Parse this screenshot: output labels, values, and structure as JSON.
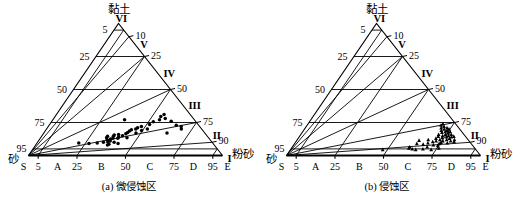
{
  "figure": {
    "type": "ternary-diagram-pair",
    "axis_labels": {
      "apex": "黏土",
      "left": "砂",
      "right": "粉砂"
    },
    "bottom_axis": {
      "letters": [
        "S",
        "A",
        "B",
        "C",
        "D",
        "E"
      ],
      "ticks": [
        "5",
        "25",
        "50",
        "75",
        "95"
      ]
    },
    "left_axis_ticks": [
      "5",
      "25",
      "50",
      "75",
      "95"
    ],
    "right_axis_ticks": [
      "90",
      "75",
      "50",
      "25",
      "10"
    ],
    "region_labels": [
      "VI",
      "V",
      "IV",
      "III",
      "II",
      "I"
    ]
  },
  "panels": [
    {
      "id": "a",
      "caption": "(a) 微侵蚀区",
      "marker": "circle",
      "chart_data": {
        "type": "scatter",
        "title": "(a) 微侵蚀区",
        "xlabel": "砂",
        "ylabel": "黏土",
        "x2label": "粉砂",
        "points": [
          [
            31.0,
            9.5
          ],
          [
            36.0,
            9.0
          ],
          [
            40.5,
            9.5
          ],
          [
            44.0,
            10.0
          ],
          [
            46.5,
            10.5
          ],
          [
            47.0,
            12.0
          ],
          [
            47.5,
            13.5
          ],
          [
            48.0,
            11.0
          ],
          [
            48.5,
            14.5
          ],
          [
            49.0,
            12.5
          ],
          [
            49.5,
            10.0
          ],
          [
            50.5,
            13.0
          ],
          [
            51.5,
            14.5
          ],
          [
            52.5,
            15.5
          ],
          [
            53.0,
            13.0
          ],
          [
            54.0,
            14.0
          ],
          [
            55.0,
            16.0
          ],
          [
            56.5,
            15.0
          ],
          [
            58.0,
            13.5
          ],
          [
            59.0,
            16.5
          ],
          [
            60.5,
            17.5
          ],
          [
            62.0,
            18.5
          ],
          [
            63.5,
            19.5
          ],
          [
            64.5,
            17.0
          ],
          [
            66.0,
            20.0
          ],
          [
            67.5,
            21.0
          ],
          [
            68.5,
            19.0
          ],
          [
            70.0,
            22.0
          ],
          [
            64.0,
            27.0
          ],
          [
            72.0,
            20.0
          ],
          [
            75.0,
            23.5
          ],
          [
            78.0,
            25.5
          ],
          [
            80.5,
            17.0
          ],
          [
            82.0,
            27.0
          ],
          [
            84.0,
            29.5
          ],
          [
            85.5,
            28.0
          ],
          [
            86.5,
            31.0
          ],
          [
            87.5,
            26.0
          ],
          [
            88.5,
            23.0
          ],
          [
            89.5,
            20.0
          ],
          [
            90.5,
            22.0
          ],
          [
            46.0,
            8.5
          ],
          [
            45.0,
            8.0
          ],
          [
            51.0,
            9.0
          ]
        ]
      }
    },
    {
      "id": "b",
      "caption": "(b) 侵蚀区",
      "marker": "triangle",
      "chart_data": {
        "type": "scatter",
        "title": "(b) 侵蚀区",
        "xlabel": "砂",
        "ylabel": "黏土",
        "x2label": "粉砂",
        "points": [
          [
            52.0,
            4.5
          ],
          [
            66.0,
            5.5
          ],
          [
            67.0,
            6.5
          ],
          [
            67.5,
            5.0
          ],
          [
            72.0,
            9.0
          ],
          [
            74.5,
            11.5
          ],
          [
            75.0,
            8.5
          ],
          [
            76.0,
            6.5
          ],
          [
            78.0,
            9.5
          ],
          [
            79.5,
            12.0
          ],
          [
            80.0,
            8.0
          ],
          [
            81.0,
            10.5
          ],
          [
            82.0,
            7.5
          ],
          [
            83.0,
            11.0
          ],
          [
            83.5,
            9.0
          ],
          [
            84.0,
            13.0
          ],
          [
            85.0,
            10.0
          ],
          [
            85.5,
            12.0
          ],
          [
            86.0,
            14.5
          ],
          [
            86.5,
            11.0
          ],
          [
            87.0,
            16.0
          ],
          [
            87.5,
            13.5
          ],
          [
            88.0,
            9.5
          ],
          [
            88.5,
            15.0
          ],
          [
            89.0,
            12.0
          ],
          [
            89.5,
            17.5
          ],
          [
            90.0,
            14.0
          ],
          [
            90.0,
            19.0
          ],
          [
            90.5,
            16.0
          ],
          [
            90.5,
            11.0
          ],
          [
            91.0,
            21.0
          ],
          [
            91.0,
            13.0
          ],
          [
            91.5,
            18.0
          ],
          [
            91.5,
            15.0
          ],
          [
            92.0,
            23.0
          ],
          [
            92.0,
            20.0
          ],
          [
            92.0,
            10.5
          ],
          [
            92.5,
            17.0
          ],
          [
            92.5,
            14.0
          ],
          [
            93.0,
            22.0
          ],
          [
            93.0,
            19.0
          ],
          [
            93.0,
            12.0
          ],
          [
            93.5,
            16.0
          ],
          [
            93.5,
            24.0
          ],
          [
            94.0,
            21.0
          ],
          [
            94.0,
            18.0
          ],
          [
            94.0,
            14.5
          ],
          [
            94.5,
            20.0
          ],
          [
            73.0,
            5.0
          ],
          [
            69.0,
            4.5
          ],
          [
            81.5,
            5.5
          ],
          [
            77.0,
            4.5
          ]
        ]
      }
    }
  ]
}
